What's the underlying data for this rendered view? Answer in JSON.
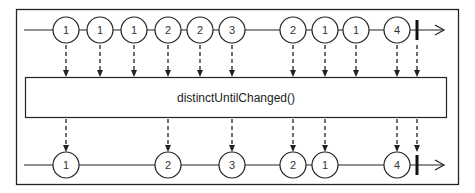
{
  "diagram": {
    "operator_label": "distinctUntilChanged()",
    "colors": {
      "stroke": "#222222",
      "background": "#ffffff"
    },
    "input_stream": {
      "y": 30,
      "start_x": 24,
      "end_x": 444,
      "completion_x": 417,
      "marbles": [
        {
          "x": 66,
          "label": "1"
        },
        {
          "x": 100,
          "label": "1"
        },
        {
          "x": 134,
          "label": "1"
        },
        {
          "x": 168,
          "label": "2"
        },
        {
          "x": 200,
          "label": "2"
        },
        {
          "x": 232,
          "label": "3"
        },
        {
          "x": 293,
          "label": "2"
        },
        {
          "x": 325,
          "label": "1"
        },
        {
          "x": 356,
          "label": "1"
        },
        {
          "x": 397,
          "label": "4"
        }
      ]
    },
    "output_stream": {
      "y": 165,
      "start_x": 24,
      "end_x": 444,
      "completion_x": 417,
      "marbles": [
        {
          "x": 66,
          "label": "1"
        },
        {
          "x": 168,
          "label": "2"
        },
        {
          "x": 232,
          "label": "3"
        },
        {
          "x": 293,
          "label": "2"
        },
        {
          "x": 325,
          "label": "1"
        },
        {
          "x": 397,
          "label": "4"
        }
      ]
    }
  }
}
